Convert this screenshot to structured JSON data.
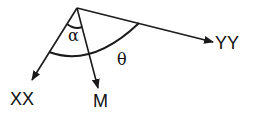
{
  "diagram": {
    "labels": {
      "xx": "XX",
      "yy": "YY",
      "m": "M",
      "alpha": "α",
      "theta": "θ"
    },
    "colors": {
      "stroke": "#1a1a1a",
      "background": "#ffffff"
    }
  }
}
